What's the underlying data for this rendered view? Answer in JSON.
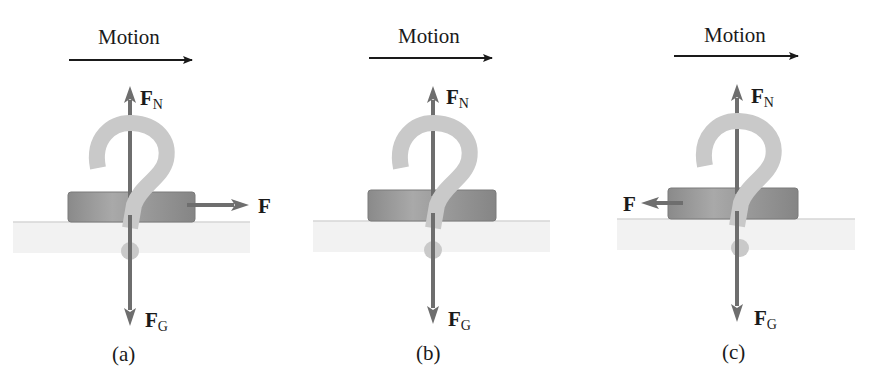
{
  "figure": {
    "colors": {
      "motion_arrow": "#1a1a1a",
      "force_arrow": "#6e6e6e",
      "block": "#8c8c8c",
      "block_highlight": "#a8a8a8",
      "question_mark": "#c9c9c9",
      "ground": "#f2f2f2",
      "ground_line": "#d6d6d6",
      "text": "#1a1a1a"
    },
    "panels": [
      {
        "id": "a",
        "caption": "(a)",
        "motion_label": "Motion",
        "normal_force_label": "F",
        "normal_force_sub": "N",
        "gravity_force_label": "F",
        "gravity_force_sub": "G",
        "applied_force_label": "F",
        "applied_force_direction": "right",
        "question_mark": "?"
      },
      {
        "id": "b",
        "caption": "(b)",
        "motion_label": "Motion",
        "normal_force_label": "F",
        "normal_force_sub": "N",
        "gravity_force_label": "F",
        "gravity_force_sub": "G",
        "applied_force_label": "",
        "applied_force_direction": "none",
        "question_mark": "?"
      },
      {
        "id": "c",
        "caption": "(c)",
        "motion_label": "Motion",
        "normal_force_label": "F",
        "normal_force_sub": "N",
        "gravity_force_label": "F",
        "gravity_force_sub": "G",
        "applied_force_label": "F",
        "applied_force_direction": "left",
        "question_mark": "?"
      }
    ]
  }
}
